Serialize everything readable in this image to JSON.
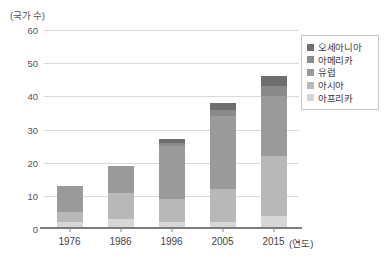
{
  "chart_data": {
    "type": "bar",
    "subtype": "stacked-bar",
    "title": "",
    "xlabel": "연도",
    "ylabel": "(국가 수)",
    "ylim": [
      0,
      60
    ],
    "ytick_step": 10,
    "grid": true,
    "legend_position": "top-right",
    "categories": [
      "1976",
      "1986",
      "1996",
      "2005",
      "2015"
    ],
    "ytick_labels": [
      "60",
      "50",
      "40",
      "30",
      "20",
      "10",
      "0"
    ],
    "ytick_values": [
      60,
      50,
      40,
      30,
      20,
      10,
      0
    ],
    "series": [
      {
        "name": "오세아니아",
        "color": "#6e6e6e",
        "values": [
          0,
          0,
          1,
          2,
          3
        ]
      },
      {
        "name": "아메리카",
        "color": "#8a8a8a",
        "values": [
          0,
          0,
          1,
          2,
          3
        ]
      },
      {
        "name": "유럽",
        "color": "#9a9a9a",
        "values": [
          8,
          8,
          16,
          22,
          18
        ]
      },
      {
        "name": "아시아",
        "color": "#b8b8b8",
        "values": [
          3,
          8,
          7,
          10,
          18
        ]
      },
      {
        "name": "아프리카",
        "color": "#d7d7d7",
        "values": [
          2,
          3,
          2,
          2,
          4
        ]
      }
    ],
    "stack_order_bottom_to_top": [
      "아프리카",
      "아시아",
      "유럽",
      "아메리카",
      "오세아니아"
    ],
    "totals": [
      13,
      19,
      27,
      38,
      55
    ],
    "colors": {
      "gridline": "#d9d9d9",
      "axis": "#7d7d7d",
      "text": "#4a4a4a",
      "legend_border": "#c8c8c8",
      "background": "#ffffff"
    }
  },
  "legend": {
    "items": [
      {
        "label": "오세아니아"
      },
      {
        "label": "아메리카"
      },
      {
        "label": "유럽"
      },
      {
        "label": "아시아"
      },
      {
        "label": "아프리카"
      }
    ]
  },
  "axis": {
    "y_title": "(국가 수)",
    "x_unit": "(연도)"
  }
}
